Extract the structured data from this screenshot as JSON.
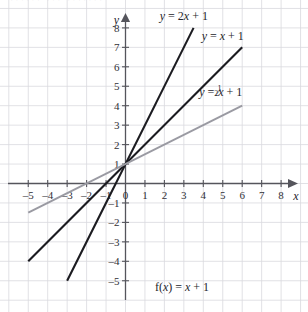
{
  "figure": {
    "cut_off_header": "······ ··· ·······",
    "caption": "f(x) = x + 1",
    "caption_f": "f(",
    "caption_x": "x",
    "caption_rest": ") = ",
    "caption_var": "x",
    "caption_tail": " + 1"
  },
  "axes": {
    "x_label": "x",
    "y_label": "y",
    "x_ticks": [
      "–5",
      "–4",
      "–3",
      "–2",
      "–1",
      "0",
      "1",
      "2",
      "3",
      "4",
      "5",
      "6",
      "7",
      "8"
    ],
    "x_values": [
      -5,
      -4,
      -3,
      -2,
      -1,
      0,
      1,
      2,
      3,
      4,
      5,
      6,
      7,
      8
    ],
    "y_ticks": [
      "8",
      "7",
      "6",
      "5",
      "4",
      "3",
      "2",
      "1",
      "–1",
      "–2",
      "–3",
      "–4",
      "–5"
    ],
    "y_values": [
      8,
      7,
      6,
      5,
      4,
      3,
      2,
      1,
      -1,
      -2,
      -3,
      -4,
      -5
    ],
    "origin_label": "0",
    "xlim": [
      -5.8,
      8.8
    ],
    "ylim": [
      -5.8,
      8.8
    ],
    "grid": true,
    "arrowheads": [
      "x-positive",
      "y-positive"
    ]
  },
  "colors": {
    "grid": "#d9d9de",
    "axis": "#55555c",
    "line_dark": "#1b1b20",
    "line_gray": "#9a9aa2",
    "background": "#ffffff"
  },
  "chart_data": {
    "type": "line",
    "title": "",
    "xlabel": "x",
    "ylabel": "y",
    "xlim": [
      -5.8,
      8.8
    ],
    "ylim": [
      -5.8,
      8.8
    ],
    "grid": true,
    "legend": "inline-labels",
    "series": [
      {
        "name": "y = 2x + 1",
        "label_parts": {
          "y": "y",
          "eq": " = 2",
          "x": "x",
          "tail": " + 1"
        },
        "slope": 2,
        "intercept": 1,
        "color": "#1b1b20",
        "x_start": -3,
        "x_end": 3.5,
        "y_start": -5,
        "y_end": 8,
        "label_x": 3.0,
        "label_y": 8.6
      },
      {
        "name": "y = x + 1",
        "label_parts": {
          "y": "y",
          "eq": " = ",
          "x": "x",
          "tail": " + 1"
        },
        "slope": 1,
        "intercept": 1,
        "color": "#1b1b20",
        "x_start": -5,
        "x_end": 6,
        "y_start": -4,
        "y_end": 7,
        "label_x": 5.0,
        "label_y": 7.6
      },
      {
        "name": "y = 1/2 x + 1",
        "label_parts": {
          "y": "y",
          "eq": " = ",
          "num": "1",
          "den": "2",
          "x": "x",
          "tail": " + 1"
        },
        "slope": 0.5,
        "intercept": 1,
        "color": "#9a9aa2",
        "x_start": -5,
        "x_end": 6,
        "y_start": -1.5,
        "y_end": 4,
        "label_x": 4.9,
        "label_y": 4.7
      }
    ]
  }
}
